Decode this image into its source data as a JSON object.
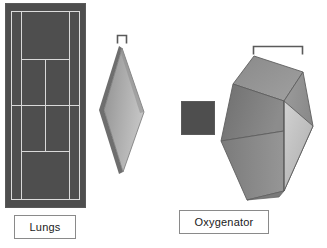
{
  "diagram": {
    "background_color": "#ffffff",
    "dark_fill_color": "#4e4e4e",
    "line_color": "#d9d9d9",
    "label_border_color": "#8a8a8a",
    "label_text_color": "#1a1a1a"
  },
  "labels": {
    "lungs": "Lungs",
    "oxygenator": "Oxygenator"
  },
  "shapes": {
    "tennis_court": {
      "name": "tennis-court",
      "description": "dark rectangular tennis court with light court markings representing lung surface area"
    },
    "lung_slab": {
      "name": "diamond-slab",
      "face_light": "#b7b7b7",
      "face_mid": "#9a9a9a",
      "edge_dark": "#6e6e6e"
    },
    "small_square": {
      "name": "small-dark-square",
      "fill": "#4e4e4e"
    },
    "oxygenator_box": {
      "name": "oxygenator-box",
      "face_top": "#8e8e8e",
      "face_left": "#7c7c7c",
      "face_front_light": "#c2c2c2",
      "face_right": "#9b9b9b",
      "face_bottom_left": "#898989",
      "edge_color": "#5f5f5f"
    },
    "bracket_small": {
      "name": "bracket-small",
      "color": "#5a5a5a"
    },
    "bracket_wide": {
      "name": "bracket-wide",
      "color": "#5a5a5a"
    }
  }
}
